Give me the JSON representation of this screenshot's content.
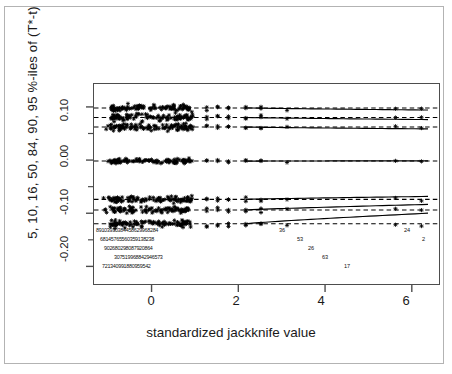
{
  "figure": {
    "xlabel": "standardized jackknife value",
    "ylabel": "5, 10, 16, 50, 84, 90, 95 %-iles of (T*-t)",
    "border_color": "#b3b3b3",
    "axis_color": "#4d4d4d",
    "point_color": "#000000"
  },
  "axis": {
    "x_ticks": [
      "0",
      "2",
      "4",
      "6"
    ],
    "y_ticks": [
      "0.10",
      "0.00",
      "-0.10",
      "-0.20"
    ]
  },
  "id_rows": [
    "89 10 39 30 38 44 58 62 99 68 28 4",
    "68 1 45 76 55 60 35 9 1 38 23 8",
    "90 26 80 29 80 87 9 20 8 64",
    "30 75 19 96 88 42 94 65 73",
    "72 13 40 99 18 80 95 95 42"
  ],
  "id_solo": [
    {
      "text": "36"
    },
    {
      "text": "53"
    },
    {
      "text": "26"
    },
    {
      "text": "63"
    },
    {
      "text": "17"
    },
    {
      "text": "24"
    },
    {
      "text": "2"
    }
  ],
  "chart_data": {
    "type": "scatter",
    "title": "",
    "xlabel": "standardized jackknife value",
    "ylabel": "5, 10, 16, 50, 84, 90, 95 %-iles of (T*-t)",
    "xlim": [
      -1.35,
      6.65
    ],
    "ylim": [
      -0.235,
      0.145
    ],
    "grid": false,
    "legend": "none",
    "series": [
      {
        "name": "95 %-ile",
        "level": 95,
        "y_center": 0.1,
        "style": "dashed-with-solid-trend"
      },
      {
        "name": "90 %-ile",
        "level": 90,
        "y_center": 0.082,
        "style": "dashed-with-solid-trend"
      },
      {
        "name": "84 %-ile",
        "level": 84,
        "y_center": 0.064,
        "style": "dashed-with-solid-trend"
      },
      {
        "name": "50 %-ile",
        "level": 50,
        "y_center": 0.0,
        "style": "dashed-with-solid-trend"
      },
      {
        "name": "16 %-ile",
        "level": 16,
        "y_center": -0.072,
        "style": "dashed-with-solid-trend"
      },
      {
        "name": "10 %-ile",
        "level": 10,
        "y_center": -0.092,
        "style": "dashed-with-solid-trend"
      },
      {
        "name": "5 %-ile",
        "level": 5,
        "y_center": -0.118,
        "style": "dashed-with-solid-trend"
      }
    ],
    "x_cloud_range": [
      -1.1,
      1.0
    ],
    "x_sparse_points": [
      1.25,
      1.5,
      1.75,
      2.15,
      2.5,
      3.1,
      5.6,
      6.2
    ],
    "n_points_per_band": 100
  }
}
